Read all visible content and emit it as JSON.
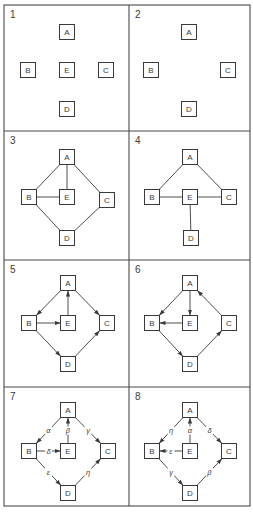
{
  "figure": {
    "layout": {
      "columns": 2,
      "rows": 4
    },
    "caption_visible_fragment": "",
    "panels": [
      {
        "number": "1",
        "nodes": [
          {
            "id": "A",
            "label": "A",
            "x": 67,
            "y": 32
          },
          {
            "id": "B",
            "label": "B",
            "x": 28,
            "y": 70
          },
          {
            "id": "E",
            "label": "E",
            "x": 67,
            "y": 70
          },
          {
            "id": "C",
            "label": "C",
            "x": 106,
            "y": 70
          },
          {
            "id": "D",
            "label": "D",
            "x": 67,
            "y": 109
          }
        ],
        "edges": []
      },
      {
        "number": "2",
        "nodes": [
          {
            "id": "A",
            "label": "A",
            "x": 189,
            "y": 32
          },
          {
            "id": "B",
            "label": "B",
            "x": 151,
            "y": 70
          },
          {
            "id": "C",
            "label": "C",
            "x": 228,
            "y": 70
          },
          {
            "id": "D",
            "label": "D",
            "x": 189,
            "y": 109
          }
        ],
        "edges": []
      },
      {
        "number": "3",
        "nodes": [
          {
            "id": "A",
            "label": "A",
            "x": 67,
            "y": 157
          },
          {
            "id": "B",
            "label": "B",
            "x": 29,
            "y": 197
          },
          {
            "id": "E",
            "label": "E",
            "x": 67,
            "y": 197
          },
          {
            "id": "C",
            "label": "C",
            "x": 107,
            "y": 200
          },
          {
            "id": "D",
            "label": "D",
            "x": 67,
            "y": 238
          }
        ],
        "edges": [
          {
            "from": "A",
            "to": "B",
            "directed": false
          },
          {
            "from": "A",
            "to": "E",
            "directed": false
          },
          {
            "from": "A",
            "to": "C",
            "directed": false
          },
          {
            "from": "B",
            "to": "E",
            "directed": false
          },
          {
            "from": "B",
            "to": "D",
            "directed": false
          },
          {
            "from": "D",
            "to": "C",
            "directed": false
          }
        ]
      },
      {
        "number": "4",
        "nodes": [
          {
            "id": "A",
            "label": "A",
            "x": 190,
            "y": 157
          },
          {
            "id": "B",
            "label": "B",
            "x": 152,
            "y": 197
          },
          {
            "id": "E",
            "label": "E",
            "x": 190,
            "y": 197
          },
          {
            "id": "C",
            "label": "C",
            "x": 229,
            "y": 197
          },
          {
            "id": "D",
            "label": "D",
            "x": 191,
            "y": 238
          }
        ],
        "edges": [
          {
            "from": "A",
            "to": "B",
            "directed": false
          },
          {
            "from": "A",
            "to": "C",
            "directed": false
          },
          {
            "from": "B",
            "to": "E",
            "directed": false
          },
          {
            "from": "E",
            "to": "C",
            "directed": false
          },
          {
            "from": "E",
            "to": "D",
            "directed": false
          }
        ]
      },
      {
        "number": "5",
        "nodes": [
          {
            "id": "A",
            "label": "A",
            "x": 68,
            "y": 283
          },
          {
            "id": "B",
            "label": "B",
            "x": 29,
            "y": 323
          },
          {
            "id": "E",
            "label": "E",
            "x": 68,
            "y": 323
          },
          {
            "id": "C",
            "label": "C",
            "x": 107,
            "y": 323
          },
          {
            "id": "D",
            "label": "D",
            "x": 68,
            "y": 364
          }
        ],
        "edges": [
          {
            "from": "A",
            "to": "B",
            "directed": true
          },
          {
            "from": "B",
            "to": "E",
            "directed": true
          },
          {
            "from": "E",
            "to": "A",
            "directed": true
          },
          {
            "from": "A",
            "to": "C",
            "directed": true
          },
          {
            "from": "B",
            "to": "D",
            "directed": true
          },
          {
            "from": "D",
            "to": "C",
            "directed": true
          }
        ]
      },
      {
        "number": "6",
        "nodes": [
          {
            "id": "A",
            "label": "A",
            "x": 190,
            "y": 283
          },
          {
            "id": "B",
            "label": "B",
            "x": 152,
            "y": 323
          },
          {
            "id": "E",
            "label": "E",
            "x": 190,
            "y": 323
          },
          {
            "id": "C",
            "label": "C",
            "x": 229,
            "y": 323
          },
          {
            "id": "D",
            "label": "D",
            "x": 190,
            "y": 364
          }
        ],
        "edges": [
          {
            "from": "A",
            "to": "B",
            "directed": true
          },
          {
            "from": "A",
            "to": "E",
            "directed": true
          },
          {
            "from": "E",
            "to": "B",
            "directed": true
          },
          {
            "from": "C",
            "to": "A",
            "directed": true
          },
          {
            "from": "B",
            "to": "D",
            "directed": true
          },
          {
            "from": "D",
            "to": "C",
            "directed": true
          }
        ]
      },
      {
        "number": "7",
        "nodes": [
          {
            "id": "A",
            "label": "A",
            "x": 68,
            "y": 410
          },
          {
            "id": "B",
            "label": "B",
            "x": 29,
            "y": 451
          },
          {
            "id": "E",
            "label": "E",
            "x": 68,
            "y": 451
          },
          {
            "id": "C",
            "label": "C",
            "x": 108,
            "y": 451
          },
          {
            "id": "D",
            "label": "D",
            "x": 68,
            "y": 493
          }
        ],
        "edges": [
          {
            "from": "A",
            "to": "B",
            "directed": true,
            "label": "α"
          },
          {
            "from": "E",
            "to": "A",
            "directed": true,
            "label": "β"
          },
          {
            "from": "A",
            "to": "C",
            "directed": true,
            "label": "γ"
          },
          {
            "from": "B",
            "to": "E",
            "directed": true,
            "label": "δ"
          },
          {
            "from": "B",
            "to": "D",
            "directed": true,
            "label": "ε"
          },
          {
            "from": "D",
            "to": "C",
            "directed": true,
            "label": "η"
          }
        ]
      },
      {
        "number": "8",
        "nodes": [
          {
            "id": "A",
            "label": "A",
            "x": 190,
            "y": 410
          },
          {
            "id": "B",
            "label": "B",
            "x": 152,
            "y": 451
          },
          {
            "id": "E",
            "label": "E",
            "x": 190,
            "y": 451
          },
          {
            "id": "C",
            "label": "C",
            "x": 229,
            "y": 451
          },
          {
            "id": "D",
            "label": "D",
            "x": 190,
            "y": 493
          }
        ],
        "edges": [
          {
            "from": "A",
            "to": "B",
            "directed": true,
            "label": "η"
          },
          {
            "from": "E",
            "to": "A",
            "directed": true,
            "label": "α"
          },
          {
            "from": "A",
            "to": "C",
            "directed": true,
            "label": "δ"
          },
          {
            "from": "E",
            "to": "B",
            "directed": true,
            "label": "ε"
          },
          {
            "from": "B",
            "to": "D",
            "directed": true,
            "label": "γ"
          },
          {
            "from": "D",
            "to": "C",
            "directed": true,
            "label": "β"
          }
        ]
      }
    ],
    "frame": {
      "x": 4,
      "y": 5,
      "width": 246,
      "height": 501,
      "col_divider_x": 129,
      "row_dividers_y": [
        131,
        260,
        387
      ]
    },
    "node_size": 15,
    "colors": {
      "ink": "#3a3a3a",
      "frame": "#4a4a4a",
      "background": "#ffffff"
    }
  }
}
